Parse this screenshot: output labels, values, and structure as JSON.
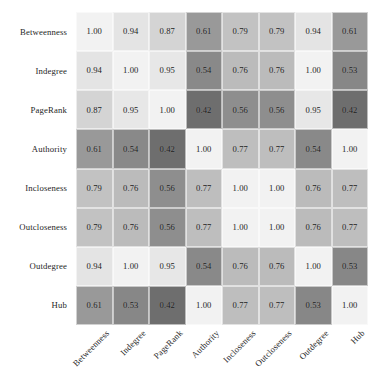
{
  "figure": {
    "caption": "",
    "background_color": "#ffffff",
    "text_color": "#262626"
  },
  "chart_data": {
    "type": "heatmap",
    "title": "",
    "xlabel": "",
    "ylabel": "",
    "grid": false,
    "legend": "none",
    "colormap": "grayscale",
    "colormap_low_color": "#6e6e6e",
    "colormap_high_color": "#f2f2f2",
    "vmin": 0.42,
    "vmax": 1.0,
    "annotate": true,
    "value_format": "0.00",
    "categories_x": [
      "Betweenness",
      "Indegree",
      "PageRank",
      "Authority",
      "Incloseness",
      "Outcloseness",
      "Outdegree",
      "Hub"
    ],
    "categories_y": [
      "Betweenness",
      "Indegree",
      "PageRank",
      "Authority",
      "Incloseness",
      "Outcloseness",
      "Outdegree",
      "Hub"
    ],
    "values": [
      [
        1.0,
        0.94,
        0.87,
        0.61,
        0.79,
        0.79,
        0.94,
        0.61
      ],
      [
        0.94,
        1.0,
        0.95,
        0.54,
        0.76,
        0.76,
        1.0,
        0.53
      ],
      [
        0.87,
        0.95,
        1.0,
        0.42,
        0.56,
        0.56,
        0.95,
        0.42
      ],
      [
        0.61,
        0.54,
        0.42,
        1.0,
        0.77,
        0.77,
        0.54,
        1.0
      ],
      [
        0.79,
        0.76,
        0.56,
        0.77,
        1.0,
        1.0,
        0.76,
        0.77
      ],
      [
        0.79,
        0.76,
        0.56,
        0.77,
        1.0,
        1.0,
        0.76,
        0.77
      ],
      [
        0.94,
        1.0,
        0.95,
        0.54,
        0.76,
        0.76,
        1.0,
        0.53
      ],
      [
        0.61,
        0.53,
        0.42,
        1.0,
        0.77,
        0.77,
        0.53,
        1.0
      ]
    ]
  }
}
